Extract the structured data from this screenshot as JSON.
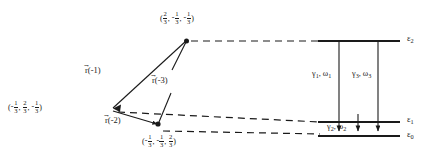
{
  "figure": {
    "type": "energy-level-and-lattice-vector-diagram",
    "stroke_color": "#1a1a1a",
    "background": "#ffffff"
  },
  "lattice": {
    "origin_label": {
      "name": "origin-coordinate",
      "text": "(-1/3, 2/3, -1/3)",
      "components": [
        {
          "sign": "-",
          "num": "1",
          "den": "3"
        },
        {
          "sign": "",
          "num": "2",
          "den": "3"
        },
        {
          "sign": "-",
          "num": "1",
          "den": "3"
        }
      ]
    },
    "upper_label": {
      "name": "upper-coordinate",
      "text": "(2/3, -1/3, -1/3)",
      "components": [
        {
          "sign": "",
          "num": "2",
          "den": "3"
        },
        {
          "sign": "-",
          "num": "1",
          "den": "3"
        },
        {
          "sign": "-",
          "num": "1",
          "den": "3"
        }
      ]
    },
    "lower_label": {
      "name": "lower-coordinate",
      "text": "(-1/3, -1/3, 2/3)",
      "components": [
        {
          "sign": "-",
          "num": "1",
          "den": "3"
        },
        {
          "sign": "-",
          "num": "1",
          "den": "3"
        },
        {
          "sign": "",
          "num": "2",
          "den": "3"
        }
      ]
    },
    "vectors": [
      {
        "id": "r1",
        "symbol": "r",
        "arg": "(-1)",
        "text": "r(-1)"
      },
      {
        "id": "r3",
        "symbol": "r",
        "arg": "(-3)",
        "text": "r(-3)"
      },
      {
        "id": "r2",
        "symbol": "r",
        "arg": "(-2)",
        "text": "r(-2)"
      }
    ]
  },
  "energy_levels": [
    {
      "id": "eps2",
      "symbol": "ε",
      "subscript": "2",
      "text": "ε2"
    },
    {
      "id": "eps1",
      "symbol": "ε",
      "subscript": "1",
      "text": "ε1"
    },
    {
      "id": "eps0",
      "symbol": "ε",
      "subscript": "0",
      "text": "ε0"
    }
  ],
  "transitions": [
    {
      "id": "t1",
      "gamma": "γ",
      "gamma_sub": "1",
      "omega": "ω",
      "omega_sub": "1",
      "text": "γ1, ω1"
    },
    {
      "id": "t3",
      "gamma": "γ",
      "gamma_sub": "3",
      "omega": "ω",
      "omega_sub": "3",
      "text": "γ3, ω3"
    },
    {
      "id": "t2",
      "gamma": "γ",
      "gamma_sub": "2",
      "omega": "ω",
      "omega_sub": "2",
      "text": "γ2, ω2"
    }
  ],
  "separators": {
    "comma": ","
  }
}
